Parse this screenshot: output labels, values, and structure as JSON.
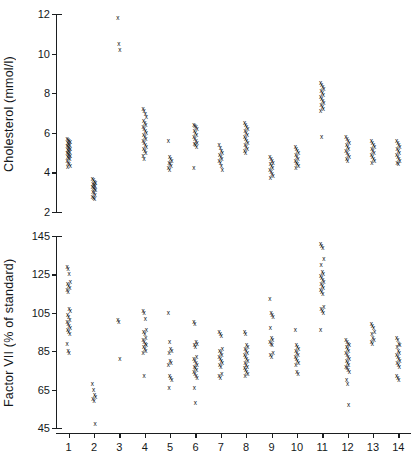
{
  "figure": {
    "background": "#ffffff",
    "marker_color": "#0c0e10",
    "axis_color": "#1b1e20",
    "marker_glyph": "x"
  },
  "chart_data": [
    {
      "type": "scatter",
      "panel": "top",
      "title": "",
      "xlabel": "",
      "ylabel": "Cholesterol (mmol/l)",
      "ylim": [
        2,
        12
      ],
      "yticks": [
        2,
        4,
        6,
        8,
        10,
        12
      ],
      "xlim": [
        0.5,
        14.5
      ],
      "xticks": [
        1,
        2,
        3,
        4,
        5,
        6,
        7,
        8,
        9,
        10,
        11,
        12,
        13,
        14
      ],
      "xticklabels": [
        "1",
        "2",
        "3",
        "4",
        "5",
        "6",
        "7",
        "8",
        "9",
        "10",
        "11",
        "12",
        "13",
        "14"
      ],
      "grid": false,
      "legend": "none",
      "categories": [
        "1",
        "2",
        "3",
        "4",
        "5",
        "6",
        "7",
        "8",
        "9",
        "10",
        "11",
        "12",
        "13",
        "14"
      ],
      "series": [
        {
          "name": "Cholesterol measurements",
          "groups": [
            {
              "x": 1,
              "values": [
                5.7,
                5.65,
                5.6,
                5.55,
                5.5,
                5.45,
                5.4,
                5.35,
                5.3,
                5.25,
                5.2,
                5.15,
                5.1,
                5.05,
                5.0,
                4.95,
                4.9,
                4.85,
                4.8,
                4.75,
                4.7,
                4.6,
                4.5,
                4.4,
                4.3,
                4.25
              ]
            },
            {
              "x": 2,
              "values": [
                3.65,
                3.6,
                3.5,
                3.45,
                3.4,
                3.35,
                3.3,
                3.25,
                3.2,
                3.15,
                3.1,
                3.0,
                2.95,
                2.85,
                2.75,
                2.7,
                2.65
              ]
            },
            {
              "x": 3,
              "values": [
                11.8,
                10.5,
                10.2
              ]
            },
            {
              "x": 4,
              "values": [
                7.2,
                7.1,
                6.95,
                6.8,
                6.6,
                6.5,
                6.4,
                6.3,
                6.2,
                6.1,
                6.0,
                5.9,
                5.8,
                5.7,
                5.6,
                5.5,
                5.4,
                5.3,
                5.2,
                5.1,
                5.0,
                4.85,
                4.7
              ]
            },
            {
              "x": 5,
              "values": [
                5.6,
                4.8,
                4.7,
                4.6,
                4.5,
                4.4,
                4.3,
                4.2,
                4.1
              ]
            },
            {
              "x": 6,
              "values": [
                6.4,
                6.35,
                6.3,
                6.2,
                6.1,
                6.0,
                5.9,
                5.8,
                5.7,
                5.6,
                5.5,
                5.45,
                5.4,
                5.3,
                4.2
              ]
            },
            {
              "x": 7,
              "values": [
                5.4,
                5.25,
                5.1,
                5.0,
                4.9,
                4.8,
                4.7,
                4.6,
                4.5,
                4.3,
                4.1
              ]
            },
            {
              "x": 8,
              "values": [
                6.5,
                6.4,
                6.3,
                6.2,
                6.1,
                6.0,
                5.9,
                5.8,
                5.7,
                5.6,
                5.5,
                5.4,
                5.3,
                5.2,
                5.1,
                5.0
              ]
            },
            {
              "x": 9,
              "values": [
                4.8,
                4.7,
                4.6,
                4.5,
                4.4,
                4.3,
                4.2,
                4.1,
                4.0,
                3.9,
                3.8,
                3.7
              ]
            },
            {
              "x": 10,
              "values": [
                5.3,
                5.2,
                5.1,
                5.0,
                4.9,
                4.8,
                4.7,
                4.6,
                4.5,
                4.4,
                4.3,
                4.2
              ]
            },
            {
              "x": 11,
              "values": [
                8.5,
                8.4,
                8.3,
                8.2,
                8.1,
                8.0,
                7.9,
                7.8,
                7.7,
                7.6,
                7.5,
                7.4,
                7.3,
                7.2,
                7.1,
                5.8
              ]
            },
            {
              "x": 12,
              "values": [
                5.8,
                5.7,
                5.6,
                5.5,
                5.4,
                5.3,
                5.2,
                5.1,
                5.0,
                4.9,
                4.8,
                4.7,
                4.6
              ]
            },
            {
              "x": 13,
              "values": [
                5.6,
                5.5,
                5.4,
                5.3,
                5.2,
                5.1,
                5.0,
                4.9,
                4.8,
                4.7,
                4.6,
                4.5
              ]
            },
            {
              "x": 14,
              "values": [
                5.6,
                5.5,
                5.4,
                5.3,
                5.2,
                5.1,
                5.0,
                4.9,
                4.8,
                4.7,
                4.6,
                4.5,
                4.4
              ]
            }
          ]
        }
      ]
    },
    {
      "type": "scatter",
      "panel": "bottom",
      "title": "",
      "xlabel": "",
      "ylabel": "Factor VII (% of standard)",
      "ylim": [
        45,
        145
      ],
      "yticks": [
        45,
        65,
        85,
        105,
        125,
        145
      ],
      "xlim": [
        0.5,
        14.5
      ],
      "xticks": [
        1,
        2,
        3,
        4,
        5,
        6,
        7,
        8,
        9,
        10,
        11,
        12,
        13,
        14
      ],
      "xticklabels": [
        "1",
        "2",
        "3",
        "4",
        "5",
        "6",
        "7",
        "8",
        "9",
        "10",
        "11",
        "12",
        "13",
        "14"
      ],
      "grid": false,
      "legend": "none",
      "categories": [
        "1",
        "2",
        "3",
        "4",
        "5",
        "6",
        "7",
        "8",
        "9",
        "10",
        "11",
        "12",
        "13",
        "14"
      ],
      "series": [
        {
          "name": "Factor VII measurements",
          "groups": [
            {
              "x": 1,
              "values": [
                129,
                128,
                125,
                121,
                120,
                119,
                118,
                117,
                116,
                107,
                106,
                104,
                103,
                101,
                100,
                99,
                98,
                97,
                96,
                95,
                94,
                89,
                85,
                84
              ]
            },
            {
              "x": 2,
              "values": [
                68,
                65,
                62,
                61,
                60,
                59,
                47
              ]
            },
            {
              "x": 3,
              "values": [
                101,
                100,
                81
              ]
            },
            {
              "x": 4,
              "values": [
                106,
                105,
                102,
                96,
                95,
                94,
                92,
                91,
                90,
                89,
                88,
                87,
                86,
                85,
                84,
                72
              ]
            },
            {
              "x": 5,
              "values": [
                105,
                90,
                86,
                85,
                84,
                80,
                79,
                78,
                72,
                71,
                70,
                66
              ]
            },
            {
              "x": 6,
              "values": [
                100,
                99,
                90,
                89,
                88,
                87,
                82,
                81,
                80,
                79,
                78,
                77,
                76,
                75,
                74,
                73,
                72,
                71,
                66,
                58
              ]
            },
            {
              "x": 7,
              "values": [
                95,
                94,
                93,
                86,
                85,
                84,
                83,
                82,
                81,
                80,
                79,
                78,
                77,
                73,
                72,
                71
              ]
            },
            {
              "x": 8,
              "values": [
                95,
                94,
                88,
                87,
                86,
                85,
                84,
                83,
                82,
                81,
                80,
                79,
                78,
                77,
                76,
                75,
                74,
                73,
                72
              ]
            },
            {
              "x": 9,
              "values": [
                112,
                105,
                104,
                103,
                97,
                92,
                91,
                90,
                89,
                88,
                84,
                83,
                82
              ]
            },
            {
              "x": 10,
              "values": [
                96,
                88,
                87,
                86,
                85,
                84,
                83,
                82,
                81,
                80,
                79,
                78,
                74,
                73
              ]
            },
            {
              "x": 11,
              "values": [
                141,
                140,
                139,
                133,
                130,
                126,
                125,
                124,
                123,
                122,
                121,
                120,
                119,
                118,
                117,
                116,
                115,
                108,
                107,
                106,
                105,
                96
              ]
            },
            {
              "x": 12,
              "values": [
                91,
                90,
                89,
                88,
                87,
                86,
                85,
                84,
                83,
                82,
                81,
                80,
                79,
                78,
                77,
                76,
                75,
                74,
                70,
                68,
                57
              ]
            },
            {
              "x": 13,
              "values": [
                99,
                98,
                97,
                95,
                94,
                92,
                91,
                90,
                89
              ]
            },
            {
              "x": 14,
              "values": [
                92,
                91,
                89,
                88,
                87,
                85,
                84,
                83,
                82,
                81,
                80,
                79,
                78,
                77,
                72,
                71,
                70
              ]
            }
          ]
        }
      ]
    }
  ]
}
